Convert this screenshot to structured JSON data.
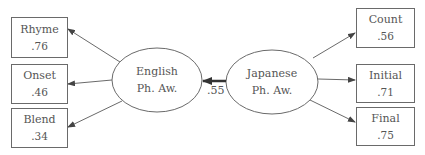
{
  "diagram": {
    "type": "structural-equation-model",
    "latents": [
      {
        "id": "english",
        "line1": "English",
        "line2": "Ph. Aw."
      },
      {
        "id": "japanese",
        "line1": "Japanese",
        "line2": "Ph. Aw."
      }
    ],
    "structural_path": {
      "from": "japanese",
      "to": "english",
      "coefficient": ".55"
    },
    "english_indicators": [
      {
        "name": "Rhyme",
        "loading": ".76"
      },
      {
        "name": "Onset",
        "loading": ".46"
      },
      {
        "name": "Blend",
        "loading": ".34"
      }
    ],
    "japanese_indicators": [
      {
        "name": "Count",
        "loading": ".56"
      },
      {
        "name": "Initial",
        "loading": ".71"
      },
      {
        "name": "Final",
        "loading": ".75"
      }
    ],
    "colors": {
      "stroke": "#6a6a6a",
      "text": "#555555",
      "structural_arrow": "#333333"
    }
  }
}
